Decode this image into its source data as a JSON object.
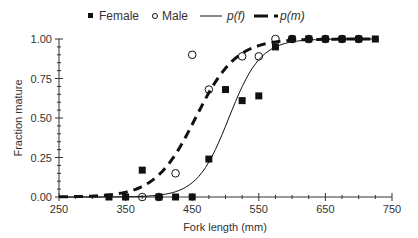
{
  "chart_data": {
    "type": "scatter",
    "title": "",
    "xlabel": "Fork length (mm)",
    "ylabel": "Fraction mature",
    "xlim": [
      250,
      750
    ],
    "ylim": [
      0,
      1
    ],
    "x_ticks": [
      "250",
      "350",
      "450",
      "550",
      "650",
      "750"
    ],
    "y_ticks": [
      "0.00",
      "0.25",
      "0.50",
      "0.75",
      "1.00"
    ],
    "grid": false,
    "legend_position": "top",
    "legend": [
      {
        "label": "Female",
        "marker": "filled-square"
      },
      {
        "label": "Male",
        "marker": "open-circle"
      },
      {
        "label": "p(f)",
        "style": "solid-line"
      },
      {
        "label": "p(m)",
        "style": "dashed-line"
      }
    ],
    "series": [
      {
        "name": "Female",
        "kind": "points",
        "marker": "filled-square",
        "x": [
          325,
          350,
          375,
          400,
          425,
          450,
          475,
          500,
          525,
          550,
          575,
          600,
          625,
          650,
          675,
          700,
          725
        ],
        "y": [
          0.0,
          0.0,
          0.17,
          0.0,
          0.0,
          0.0,
          0.24,
          0.68,
          0.61,
          0.64,
          0.95,
          1.0,
          1.0,
          1.0,
          1.0,
          1.0,
          1.0
        ]
      },
      {
        "name": "Male",
        "kind": "points",
        "marker": "open-circle",
        "x": [
          375,
          400,
          425,
          450,
          475,
          525,
          550,
          575,
          600,
          625,
          650,
          675,
          700
        ],
        "y": [
          0.0,
          0.0,
          0.15,
          0.9,
          0.68,
          0.89,
          0.89,
          1.0,
          1.0,
          1.0,
          1.0,
          1.0,
          1.0
        ]
      },
      {
        "name": "p(f)",
        "kind": "logistic-curve",
        "style": "solid",
        "midpoint_mm": 505,
        "slope": 0.042
      },
      {
        "name": "p(m)",
        "kind": "logistic-curve",
        "style": "dashed",
        "midpoint_mm": 455,
        "slope": 0.033
      }
    ]
  },
  "colors": {
    "marker": "#111111",
    "axis": "#333333",
    "text": "#333333"
  }
}
